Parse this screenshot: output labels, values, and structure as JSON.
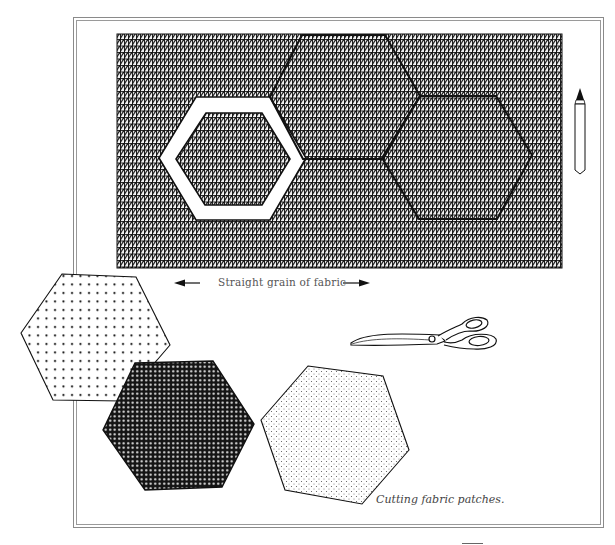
{
  "figure": {
    "caption": "Cutting fabric patches.",
    "grain_label": "Straight grain of fabric",
    "colors": {
      "ink": "#111111",
      "paper": "#ffffff",
      "frame": "#8a8a8a",
      "label": "#555555"
    }
  },
  "fabric_sheet": {
    "pattern": "grid-with-diagonal-hatch",
    "marked_hexagons": [
      {
        "name": "template-ring",
        "style": "white-window-template"
      },
      {
        "name": "top-hexagon",
        "style": "outline"
      },
      {
        "name": "right-hexagon",
        "style": "outline"
      }
    ]
  },
  "patches": [
    {
      "name": "large-dot-patch",
      "pattern": "large dots"
    },
    {
      "name": "dark-patch",
      "pattern": "dense dark"
    },
    {
      "name": "fine-dot-patch",
      "pattern": "fine dots"
    }
  ],
  "tools": [
    {
      "name": "pencil-icon"
    },
    {
      "name": "scissors-icon"
    }
  ],
  "arrows": [
    {
      "name": "arrow-left-icon",
      "direction": "left"
    },
    {
      "name": "arrow-right-icon",
      "direction": "right"
    }
  ]
}
